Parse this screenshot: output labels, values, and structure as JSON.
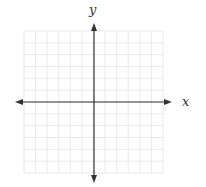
{
  "diagram": {
    "type": "coordinate-plane",
    "x_label": "x",
    "y_label": "y",
    "grid": {
      "columns": 12,
      "rows": 12,
      "left": 24,
      "top": 31,
      "right": 163,
      "bottom": 173,
      "color": "#e4e4e4"
    },
    "axes": {
      "origin_x": 94,
      "origin_y": 102,
      "x_start": 15,
      "x_end": 172,
      "y_start": 23,
      "y_end": 183,
      "color": "#333333"
    }
  }
}
